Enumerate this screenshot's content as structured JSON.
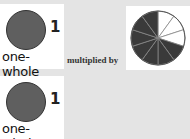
{
  "rows": [
    {
      "value": "1",
      "label": "one-whole",
      "color": "#5f5f5f"
    },
    {
      "value": "1",
      "label": "one-whole",
      "color": "#5f5f5f"
    }
  ],
  "operator_text": "multiplied by",
  "pie": {
    "total_slices": 10,
    "unshaded_slices": 3,
    "shaded_color": "#3a3a3a",
    "unshaded_color": "#ffffff",
    "line_color": "#888888"
  }
}
